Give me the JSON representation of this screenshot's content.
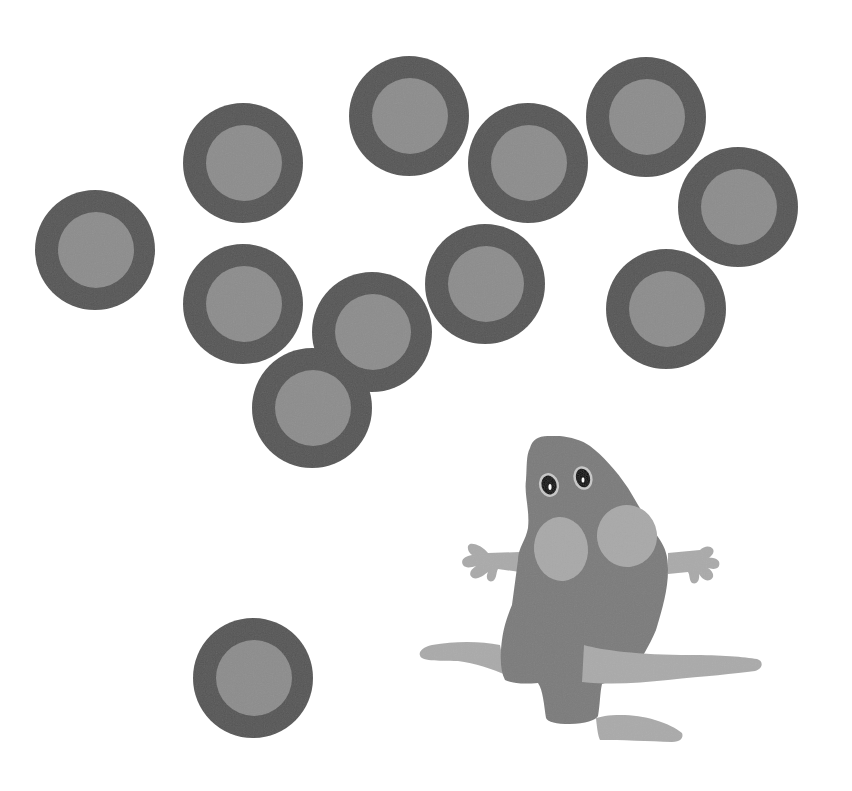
{
  "scene": {
    "description": "Grayscale paper cutout illustration of a mouse with twelve ring-shaped circles",
    "background": "#ffffff",
    "colors": {
      "ring_outer": "#565656",
      "ring_inner": "#8d8d8d",
      "mouse_body": "#7b7b7b",
      "mouse_limbs": "#aaaaaa",
      "mouse_cheeks": "#a9a9a9",
      "eye_outline": "#c8c8c8",
      "eye_pupil": "#111111",
      "eye_highlight": "#ffffff"
    },
    "circle_outer_radius": 60,
    "circle_inner_radius": 38,
    "circles": [
      {
        "cx": 95,
        "cy": 250
      },
      {
        "cx": 243,
        "cy": 163
      },
      {
        "cx": 409,
        "cy": 116
      },
      {
        "cx": 528,
        "cy": 163
      },
      {
        "cx": 646,
        "cy": 117
      },
      {
        "cx": 738,
        "cy": 207
      },
      {
        "cx": 243,
        "cy": 304
      },
      {
        "cx": 485,
        "cy": 284
      },
      {
        "cx": 666,
        "cy": 309
      },
      {
        "cx": 372,
        "cy": 332
      },
      {
        "cx": 312,
        "cy": 408
      },
      {
        "cx": 253,
        "cy": 678
      }
    ],
    "mouse": {
      "label": "paper mouse"
    }
  }
}
